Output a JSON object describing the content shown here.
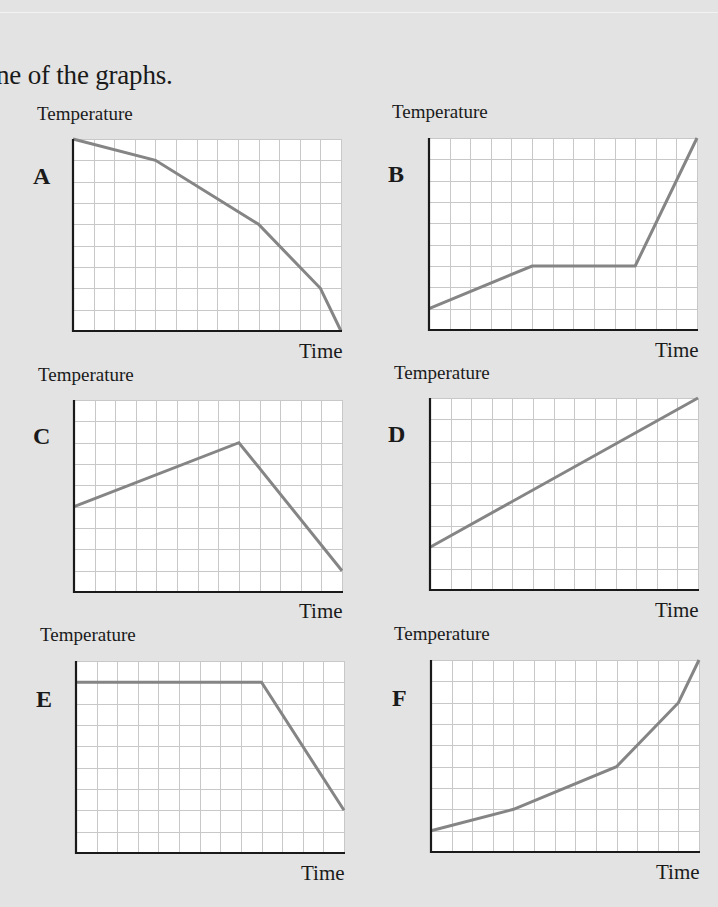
{
  "heading": "ne of the graphs.",
  "colors": {
    "background": "#e3e3e3",
    "plot_bg": "#ffffff",
    "grid": "#c8c8c8",
    "axis": "#1a1a1a",
    "line": "#858585"
  },
  "graphs": [
    {
      "letter": "A",
      "ylabel": "Temperature",
      "xlabel": "Time"
    },
    {
      "letter": "B",
      "ylabel": "Temperature",
      "xlabel": "Time"
    },
    {
      "letter": "C",
      "ylabel": "Temperature",
      "xlabel": "Time"
    },
    {
      "letter": "D",
      "ylabel": "Temperature",
      "xlabel": "Time"
    },
    {
      "letter": "E",
      "ylabel": "Temperature",
      "xlabel": "Time"
    },
    {
      "letter": "F",
      "ylabel": "Temperature",
      "xlabel": "Time"
    }
  ],
  "chart_data": [
    {
      "type": "line",
      "title": "A",
      "xlabel": "Time",
      "ylabel": "Temperature",
      "grid": true,
      "xlim": [
        0,
        13
      ],
      "ylim": [
        0,
        9
      ],
      "x": [
        0,
        4,
        9,
        12,
        13
      ],
      "y": [
        9,
        8,
        5,
        2,
        0
      ]
    },
    {
      "type": "line",
      "title": "B",
      "xlabel": "Time",
      "ylabel": "Temperature",
      "grid": true,
      "xlim": [
        0,
        13
      ],
      "ylim": [
        0,
        9
      ],
      "x": [
        0,
        5,
        10,
        13
      ],
      "y": [
        1,
        3,
        3,
        9
      ]
    },
    {
      "type": "line",
      "title": "C",
      "xlabel": "Time",
      "ylabel": "Temperature",
      "grid": true,
      "xlim": [
        0,
        13
      ],
      "ylim": [
        0,
        9
      ],
      "x": [
        0,
        8,
        13
      ],
      "y": [
        4,
        7,
        1
      ]
    },
    {
      "type": "line",
      "title": "D",
      "xlabel": "Time",
      "ylabel": "Temperature",
      "grid": true,
      "xlim": [
        0,
        13
      ],
      "ylim": [
        0,
        9
      ],
      "x": [
        0,
        13
      ],
      "y": [
        2,
        9
      ]
    },
    {
      "type": "line",
      "title": "E",
      "xlabel": "Time",
      "ylabel": "Temperature",
      "grid": true,
      "xlim": [
        0,
        13
      ],
      "ylim": [
        0,
        9
      ],
      "x": [
        0,
        9,
        13
      ],
      "y": [
        8,
        8,
        2
      ]
    },
    {
      "type": "line",
      "title": "F",
      "xlabel": "Time",
      "ylabel": "Temperature",
      "grid": true,
      "xlim": [
        0,
        13
      ],
      "ylim": [
        0,
        9
      ],
      "x": [
        0,
        4,
        9,
        12,
        13
      ],
      "y": [
        1,
        2,
        4,
        7,
        9
      ]
    }
  ]
}
